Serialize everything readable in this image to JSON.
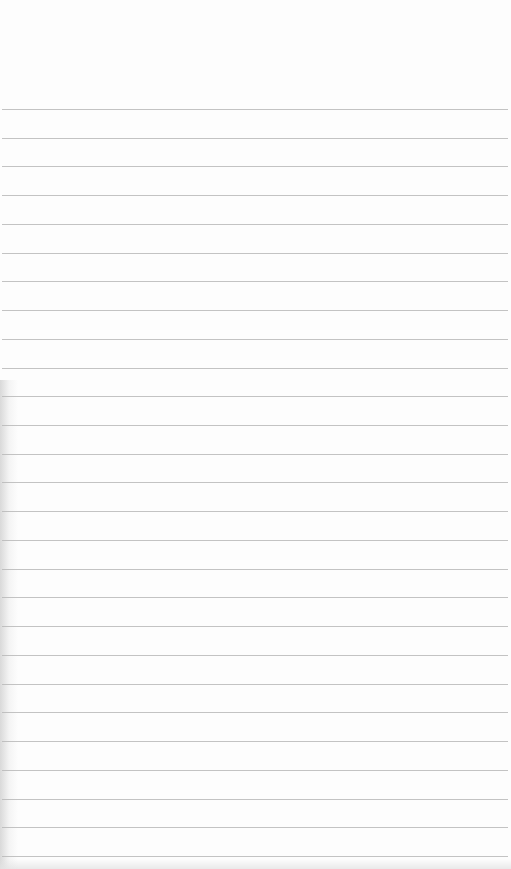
{
  "page": {
    "type": "lined-paper",
    "background_color": "#fdfdfd",
    "rule_color": "#b9b9b9",
    "first_rule_y": 109,
    "rule_spacing": 28.73,
    "rule_count": 27,
    "rule_left": 2,
    "rule_width": 506
  }
}
